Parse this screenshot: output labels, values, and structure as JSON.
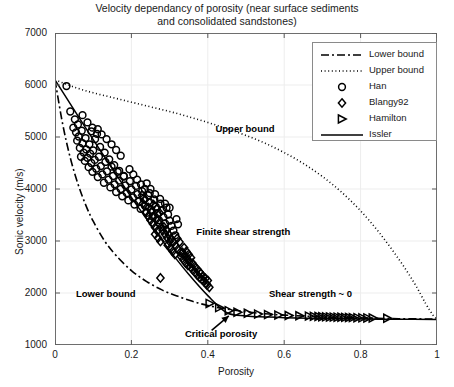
{
  "chart_data": {
    "type": "scatter",
    "title": "Velocity dependancy of porosity (near surface sediments and consolidated sandstones)",
    "title_line1": "Velocity dependancy of porosity (near surface sediments",
    "title_line2": "and consolidated sandstones)",
    "xlabel": "Porosity",
    "ylabel": "Sonic velocity (m/s)",
    "xlim": [
      0,
      1
    ],
    "ylim": [
      1000,
      7000
    ],
    "xticks": [
      "0",
      "0.2",
      "0.4",
      "0.6",
      "0.8",
      "1"
    ],
    "xtick_values": [
      0,
      0.2,
      0.4,
      0.6,
      0.8,
      1
    ],
    "yticks": [
      "1000",
      "2000",
      "3000",
      "4000",
      "5000",
      "6000",
      "7000"
    ],
    "ytick_values": [
      1000,
      2000,
      3000,
      4000,
      5000,
      6000,
      7000
    ],
    "grid": true,
    "legend_position": "upper right",
    "legend_entries": [
      {
        "label": "Lower bound",
        "style": "dashdot-line"
      },
      {
        "label": "Upper bound",
        "style": "dotted-line"
      },
      {
        "label": "Han",
        "style": "circle-marker"
      },
      {
        "label": "Blangy92",
        "style": "diamond-marker"
      },
      {
        "label": "Hamilton",
        "style": "triangle-right-marker"
      },
      {
        "label": "Issler",
        "style": "solid-line"
      }
    ],
    "annotations": [
      {
        "text": "Upper bound",
        "x": 0.42,
        "y": 5150
      },
      {
        "text": "Finite shear strength",
        "x": 0.37,
        "y": 3180
      },
      {
        "text": "Lower bound",
        "x": 0.055,
        "y": 1990
      },
      {
        "text": "Shear strength ~ 0",
        "x": 0.56,
        "y": 1980
      },
      {
        "text": "Critical porosity",
        "x": 0.34,
        "y": 1210
      }
    ],
    "arrow": {
      "from_x": 0.41,
      "from_y": 1280,
      "to_x": 0.455,
      "to_y": 1560,
      "label": "Critical porosity"
    },
    "series": [
      {
        "name": "Lower bound",
        "type": "line",
        "style": "dashdot",
        "x": [
          0.0,
          0.02,
          0.04,
          0.06,
          0.08,
          0.1,
          0.13,
          0.16,
          0.2,
          0.24,
          0.28,
          0.32,
          0.36,
          0.4,
          0.45,
          0.5,
          0.55,
          0.6,
          0.7,
          0.8,
          0.9,
          1.0
        ],
        "y": [
          6100,
          5250,
          4600,
          4100,
          3700,
          3380,
          3000,
          2720,
          2430,
          2220,
          2060,
          1940,
          1840,
          1760,
          1690,
          1640,
          1600,
          1575,
          1540,
          1520,
          1505,
          1500
        ]
      },
      {
        "name": "Upper bound",
        "type": "line",
        "style": "dotted",
        "x": [
          0.0,
          0.05,
          0.1,
          0.15,
          0.2,
          0.25,
          0.3,
          0.35,
          0.4,
          0.45,
          0.5,
          0.55,
          0.6,
          0.65,
          0.7,
          0.75,
          0.8,
          0.85,
          0.9,
          0.94,
          0.97,
          0.99,
          1.0
        ],
        "y": [
          6100,
          5960,
          5850,
          5760,
          5670,
          5580,
          5490,
          5390,
          5280,
          5160,
          5030,
          4880,
          4700,
          4490,
          4240,
          3940,
          3580,
          3150,
          2650,
          2200,
          1800,
          1570,
          1500
        ]
      },
      {
        "name": "Issler",
        "type": "line",
        "style": "solid",
        "x": [
          0.0,
          0.05,
          0.1,
          0.15,
          0.2,
          0.25,
          0.3,
          0.35,
          0.4,
          0.45,
          0.5,
          0.55,
          0.6,
          0.7,
          0.8,
          0.9,
          1.0
        ],
        "y": [
          6100,
          5520,
          4950,
          4390,
          3840,
          3320,
          2820,
          2360,
          1950,
          1620,
          1560,
          1540,
          1525,
          1510,
          1500,
          1495,
          1490
        ]
      },
      {
        "name": "Han",
        "type": "scatter",
        "marker": "circle",
        "points": [
          [
            0.03,
            5980
          ],
          [
            0.04,
            5490
          ],
          [
            0.048,
            5180
          ],
          [
            0.052,
            5340
          ],
          [
            0.055,
            5090
          ],
          [
            0.058,
            4930
          ],
          [
            0.06,
            5240
          ],
          [
            0.062,
            5010
          ],
          [
            0.065,
            4790
          ],
          [
            0.068,
            4620
          ],
          [
            0.07,
            5120
          ],
          [
            0.072,
            4880
          ],
          [
            0.075,
            4700
          ],
          [
            0.078,
            4540
          ],
          [
            0.08,
            4980
          ],
          [
            0.082,
            4760
          ],
          [
            0.085,
            4600
          ],
          [
            0.088,
            4420
          ],
          [
            0.09,
            4860
          ],
          [
            0.092,
            4680
          ],
          [
            0.095,
            4500
          ],
          [
            0.098,
            4330
          ],
          [
            0.1,
            4740
          ],
          [
            0.104,
            4560
          ],
          [
            0.108,
            4390
          ],
          [
            0.112,
            4230
          ],
          [
            0.115,
            4620
          ],
          [
            0.12,
            4440
          ],
          [
            0.124,
            4280
          ],
          [
            0.128,
            4120
          ],
          [
            0.132,
            4520
          ],
          [
            0.136,
            4340
          ],
          [
            0.14,
            4180
          ],
          [
            0.145,
            4030
          ],
          [
            0.148,
            4430
          ],
          [
            0.152,
            4250
          ],
          [
            0.156,
            4090
          ],
          [
            0.16,
            3940
          ],
          [
            0.164,
            4330
          ],
          [
            0.168,
            4160
          ],
          [
            0.172,
            4000
          ],
          [
            0.176,
            3860
          ],
          [
            0.18,
            4240
          ],
          [
            0.184,
            4070
          ],
          [
            0.188,
            3920
          ],
          [
            0.192,
            3780
          ],
          [
            0.196,
            4150
          ],
          [
            0.2,
            3990
          ],
          [
            0.204,
            3840
          ],
          [
            0.208,
            3700
          ],
          [
            0.212,
            4060
          ],
          [
            0.216,
            3900
          ],
          [
            0.22,
            3760
          ],
          [
            0.224,
            3620
          ],
          [
            0.095,
            5110
          ],
          [
            0.105,
            4960
          ],
          [
            0.118,
            4810
          ],
          [
            0.13,
            4700
          ],
          [
            0.142,
            4570
          ],
          [
            0.155,
            4460
          ],
          [
            0.168,
            4350
          ],
          [
            0.18,
            4250
          ],
          [
            0.072,
            5420
          ],
          [
            0.085,
            5280
          ],
          [
            0.098,
            5180
          ],
          [
            0.11,
            5060
          ],
          [
            0.228,
            3960
          ],
          [
            0.232,
            3810
          ],
          [
            0.236,
            3670
          ],
          [
            0.24,
            3540
          ],
          [
            0.244,
            3880
          ],
          [
            0.248,
            3740
          ],
          [
            0.252,
            3600
          ],
          [
            0.256,
            3470
          ],
          [
            0.26,
            3800
          ],
          [
            0.264,
            3660
          ],
          [
            0.268,
            3530
          ],
          [
            0.272,
            3400
          ],
          [
            0.276,
            3720
          ],
          [
            0.28,
            3590
          ],
          [
            0.284,
            3460
          ],
          [
            0.288,
            3340
          ],
          [
            0.292,
            3640
          ],
          [
            0.296,
            3510
          ],
          [
            0.24,
            4110
          ],
          [
            0.25,
            4000
          ],
          [
            0.262,
            3900
          ],
          [
            0.275,
            3810
          ],
          [
            0.288,
            3720
          ],
          [
            0.3,
            3640
          ],
          [
            0.195,
            4380
          ],
          [
            0.205,
            4280
          ],
          [
            0.215,
            4180
          ],
          [
            0.225,
            4090
          ],
          [
            0.235,
            4000
          ],
          [
            0.248,
            3920
          ],
          [
            0.3,
            3390
          ],
          [
            0.305,
            3290
          ],
          [
            0.31,
            3200
          ],
          [
            0.315,
            3110
          ],
          [
            0.318,
            3420
          ],
          [
            0.322,
            3320
          ],
          [
            0.16,
            4750
          ],
          [
            0.172,
            4640
          ],
          [
            0.148,
            4860
          ],
          [
            0.135,
            4960
          ],
          [
            0.122,
            5050
          ],
          [
            0.112,
            5150
          ]
        ]
      },
      {
        "name": "Blangy92",
        "type": "scatter",
        "marker": "diamond",
        "points": [
          [
            0.238,
            3560
          ],
          [
            0.244,
            3480
          ],
          [
            0.25,
            3400
          ],
          [
            0.256,
            3330
          ],
          [
            0.262,
            3260
          ],
          [
            0.268,
            3190
          ],
          [
            0.245,
            3640
          ],
          [
            0.252,
            3560
          ],
          [
            0.258,
            3480
          ],
          [
            0.265,
            3410
          ],
          [
            0.272,
            3340
          ],
          [
            0.278,
            3270
          ],
          [
            0.258,
            3700
          ],
          [
            0.266,
            3620
          ],
          [
            0.274,
            3540
          ],
          [
            0.262,
            3130
          ],
          [
            0.27,
            3060
          ],
          [
            0.276,
            2990
          ],
          [
            0.282,
            3200
          ],
          [
            0.288,
            3130
          ],
          [
            0.294,
            3060
          ],
          [
            0.3,
            2990
          ],
          [
            0.285,
            3270
          ],
          [
            0.292,
            3200
          ],
          [
            0.298,
            3120
          ],
          [
            0.304,
            3050
          ],
          [
            0.295,
            2920
          ],
          [
            0.302,
            2860
          ],
          [
            0.308,
            2800
          ],
          [
            0.314,
            2740
          ],
          [
            0.31,
            2980
          ],
          [
            0.316,
            2910
          ],
          [
            0.322,
            2840
          ],
          [
            0.328,
            2780
          ],
          [
            0.32,
            3050
          ],
          [
            0.326,
            2980
          ],
          [
            0.33,
            2700
          ],
          [
            0.336,
            2640
          ],
          [
            0.342,
            2580
          ],
          [
            0.348,
            2530
          ],
          [
            0.334,
            2780
          ],
          [
            0.34,
            2720
          ],
          [
            0.346,
            2660
          ],
          [
            0.352,
            2600
          ],
          [
            0.338,
            2870
          ],
          [
            0.344,
            2800
          ],
          [
            0.35,
            2740
          ],
          [
            0.356,
            2680
          ],
          [
            0.355,
            2500
          ],
          [
            0.36,
            2450
          ],
          [
            0.366,
            2400
          ],
          [
            0.372,
            2350
          ],
          [
            0.36,
            2570
          ],
          [
            0.366,
            2510
          ],
          [
            0.372,
            2460
          ],
          [
            0.378,
            2410
          ],
          [
            0.378,
            2300
          ],
          [
            0.384,
            2260
          ],
          [
            0.39,
            2220
          ],
          [
            0.396,
            2180
          ],
          [
            0.382,
            2370
          ],
          [
            0.388,
            2320
          ],
          [
            0.394,
            2280
          ],
          [
            0.4,
            2240
          ],
          [
            0.398,
            2150
          ],
          [
            0.404,
            2110
          ],
          [
            0.276,
            2290
          ],
          [
            0.23,
            3720
          ],
          [
            0.236,
            3800
          ],
          [
            0.228,
            3880
          ]
        ]
      },
      {
        "name": "Hamilton",
        "type": "scatter",
        "marker": "triangle-right",
        "points": [
          [
            0.405,
            1800
          ],
          [
            0.43,
            1720
          ],
          [
            0.455,
            1660
          ],
          [
            0.478,
            1630
          ],
          [
            0.505,
            1610
          ],
          [
            0.532,
            1595
          ],
          [
            0.558,
            1585
          ],
          [
            0.585,
            1575
          ],
          [
            0.612,
            1568
          ],
          [
            0.64,
            1562
          ],
          [
            0.665,
            1556
          ],
          [
            0.678,
            1552
          ],
          [
            0.69,
            1548
          ],
          [
            0.7,
            1545
          ],
          [
            0.71,
            1542
          ],
          [
            0.72,
            1540
          ],
          [
            0.73,
            1537
          ],
          [
            0.74,
            1535
          ],
          [
            0.75,
            1533
          ],
          [
            0.76,
            1531
          ],
          [
            0.77,
            1529
          ],
          [
            0.78,
            1527
          ],
          [
            0.792,
            1525
          ],
          [
            0.805,
            1523
          ],
          [
            0.818,
            1521
          ],
          [
            0.832,
            1519
          ],
          [
            0.87,
            1515
          ]
        ]
      }
    ]
  }
}
